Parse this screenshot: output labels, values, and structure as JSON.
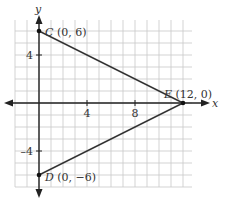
{
  "diagram": {
    "type": "coordinate-plane-triangle",
    "axes": {
      "x_label": "x",
      "y_label": "y",
      "x_ticks": [
        {
          "value": 4,
          "label": "4"
        },
        {
          "value": 8,
          "label": "8"
        }
      ],
      "y_ticks": [
        {
          "value": 4,
          "label": "4"
        },
        {
          "value": -4,
          "label": "-4"
        }
      ],
      "x_range": [
        -2,
        12.75
      ],
      "y_range": [
        -7,
        7
      ],
      "grid": true,
      "grid_step": 1
    },
    "points": [
      {
        "name": "C",
        "coords": "(0, 6)",
        "x": 0,
        "y": 6
      },
      {
        "name": "D",
        "coords": "(0, −6)",
        "x": 0,
        "y": -6
      },
      {
        "name": "E",
        "coords": "(12, 0)",
        "x": 12,
        "y": 0
      }
    ],
    "segments": [
      [
        "C",
        "E"
      ],
      [
        "D",
        "E"
      ],
      [
        "C",
        "D"
      ]
    ],
    "colors": {
      "grid": "#c8c8c8",
      "axis": "#222222",
      "segment": "#333333",
      "text": "#333333"
    }
  }
}
